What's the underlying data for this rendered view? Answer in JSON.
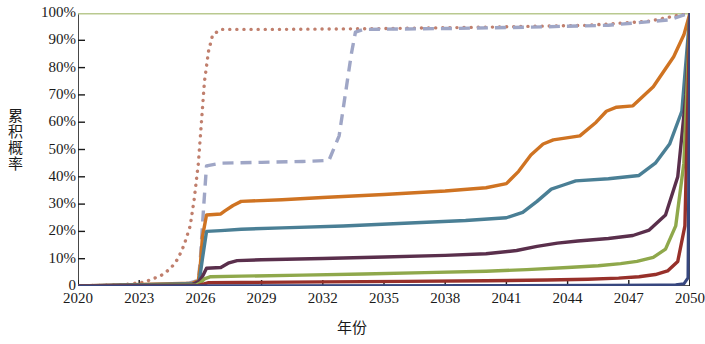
{
  "chart_data": {
    "type": "line",
    "title": "",
    "xlabel": "年份",
    "ylabel": "累积概率",
    "xlim": [
      2020,
      2050
    ],
    "ylim": [
      0,
      100
    ],
    "grid": false,
    "legend_position": "none",
    "x_ticks": [
      "2020",
      "2023",
      "2026",
      "2029",
      "2032",
      "2035",
      "2038",
      "2041",
      "2044",
      "2047",
      "2050"
    ],
    "y_ticks": [
      "0",
      "10%",
      "20%",
      "30%",
      "40%",
      "50%",
      "60%",
      "70%",
      "80%",
      "90%",
      "100%"
    ],
    "y_tick_values": [
      0,
      10,
      20,
      30,
      40,
      50,
      60,
      70,
      80,
      90,
      100
    ],
    "series": [
      {
        "name": "series-1-pale-green",
        "color": "#b9c98f",
        "style": "solid",
        "width": 3.2,
        "x": [
          2020,
          2050
        ],
        "values": [
          100,
          100
        ]
      },
      {
        "name": "series-2-dusty-rose-dotted",
        "color": "#c07f6d",
        "style": "dotted",
        "width": 3.4,
        "x": [
          2020,
          2022.2,
          2022.8,
          2023.3,
          2023.6,
          2024.0,
          2024.3,
          2024.6,
          2024.9,
          2025.2,
          2025.5,
          2025.7,
          2025.9,
          2026.05,
          2026.2,
          2026.4,
          2026.6,
          2027.0,
          2030,
          2035,
          2040,
          2045,
          2048,
          2050
        ],
        "values": [
          0,
          0.5,
          1,
          1.5,
          2.5,
          3.5,
          5,
          7,
          10,
          15,
          22,
          32,
          45,
          60,
          75,
          86,
          92,
          94,
          94,
          94.3,
          94.8,
          95.5,
          97,
          100
        ]
      },
      {
        "name": "series-3-lavender-dashed",
        "color": "#9fa6c6",
        "style": "dashed",
        "width": 3.4,
        "x": [
          2020,
          2024.5,
          2025.4,
          2025.9,
          2026.0,
          2026.15,
          2026.3,
          2027,
          2029,
          2031,
          2032.3,
          2032.8,
          2033.1,
          2033.4,
          2033.6,
          2034,
          2038,
          2042,
          2046,
          2049,
          2050
        ],
        "values": [
          0,
          0.5,
          1,
          2,
          10,
          28,
          44,
          45,
          45.3,
          45.6,
          46,
          55,
          70,
          85,
          93,
          94,
          94.3,
          94.8,
          95.5,
          97.5,
          100
        ]
      },
      {
        "name": "series-4-orange",
        "color": "#cf7322",
        "style": "solid",
        "width": 3.4,
        "x": [
          2020,
          2025.6,
          2025.9,
          2026.0,
          2026.1,
          2026.3,
          2027.0,
          2027.2,
          2027.6,
          2028.0,
          2030,
          2032,
          2035,
          2038,
          2040,
          2041.0,
          2041.6,
          2042.2,
          2042.8,
          2043.3,
          2044.6,
          2045.4,
          2045.9,
          2046.4,
          2047.2,
          2048.2,
          2049.2,
          2049.7,
          2050
        ],
        "values": [
          0,
          1,
          2,
          8,
          18,
          26,
          26.4,
          27.5,
          29.5,
          31,
          31.6,
          32.4,
          33.5,
          34.8,
          36,
          37.5,
          42,
          48,
          52,
          53.5,
          55,
          60,
          64,
          65.5,
          66,
          73,
          84,
          92,
          100
        ]
      },
      {
        "name": "series-5-teal",
        "color": "#4a7f95",
        "style": "solid",
        "width": 3.4,
        "x": [
          2020,
          2025.7,
          2025.95,
          2026.1,
          2026.3,
          2027.0,
          2028,
          2030,
          2033,
          2036,
          2039,
          2041,
          2041.8,
          2042.5,
          2043.2,
          2043.8,
          2044.4,
          2046,
          2047.5,
          2048.3,
          2049.0,
          2049.6,
          2050
        ],
        "values": [
          0,
          0.8,
          2,
          10,
          20,
          20.3,
          20.8,
          21.3,
          22,
          23,
          24,
          25,
          27,
          31,
          35.5,
          37,
          38.5,
          39.3,
          40.5,
          45,
          52,
          64,
          100
        ]
      },
      {
        "name": "series-6-dark-purple",
        "color": "#5a2f4c",
        "style": "solid",
        "width": 3.4,
        "x": [
          2020,
          2025.6,
          2025.9,
          2026.1,
          2026.3,
          2027.0,
          2027.4,
          2027.8,
          2029,
          2032,
          2035,
          2038,
          2040,
          2041.5,
          2042.5,
          2043.5,
          2044.5,
          2046,
          2047.2,
          2048.0,
          2048.8,
          2049.4,
          2049.8,
          2050
        ],
        "values": [
          0,
          0.5,
          1.5,
          3.5,
          6.5,
          6.8,
          8.5,
          9.3,
          9.6,
          10.1,
          10.6,
          11.2,
          11.8,
          13,
          14.5,
          15.7,
          16.5,
          17.4,
          18.5,
          20.5,
          26,
          40,
          70,
          100
        ]
      },
      {
        "name": "series-7-olive-green",
        "color": "#8fa84b",
        "style": "solid",
        "width": 3.4,
        "x": [
          2020,
          2025.8,
          2026.0,
          2026.2,
          2026.5,
          2028,
          2031,
          2034,
          2037,
          2040,
          2042,
          2044,
          2045.5,
          2046.6,
          2047.4,
          2048.2,
          2048.8,
          2049.3,
          2049.7,
          2050
        ],
        "values": [
          0,
          0.4,
          1.2,
          2.6,
          3.4,
          3.6,
          4.0,
          4.4,
          4.9,
          5.4,
          6.0,
          6.8,
          7.4,
          8.2,
          9.0,
          10.5,
          13.5,
          22,
          45,
          100
        ]
      },
      {
        "name": "series-8-dark-red",
        "color": "#97302a",
        "style": "solid",
        "width": 3.4,
        "x": [
          2020,
          2025.9,
          2026.1,
          2026.4,
          2028,
          2032,
          2036,
          2040,
          2043,
          2045,
          2046.5,
          2047.5,
          2048.3,
          2048.9,
          2049.4,
          2049.75,
          2050
        ],
        "values": [
          0,
          0.2,
          0.6,
          1.2,
          1.3,
          1.5,
          1.7,
          1.9,
          2.2,
          2.5,
          2.9,
          3.4,
          4.2,
          5.5,
          9,
          22,
          100
        ]
      },
      {
        "name": "series-9-navy",
        "color": "#37477f",
        "style": "solid",
        "width": 3.0,
        "x": [
          2020,
          2040,
          2046,
          2048.5,
          2049.3,
          2049.7,
          2049.9,
          2050
        ],
        "values": [
          0,
          0.2,
          0.3,
          0.4,
          0.5,
          0.8,
          3,
          100
        ]
      }
    ]
  }
}
